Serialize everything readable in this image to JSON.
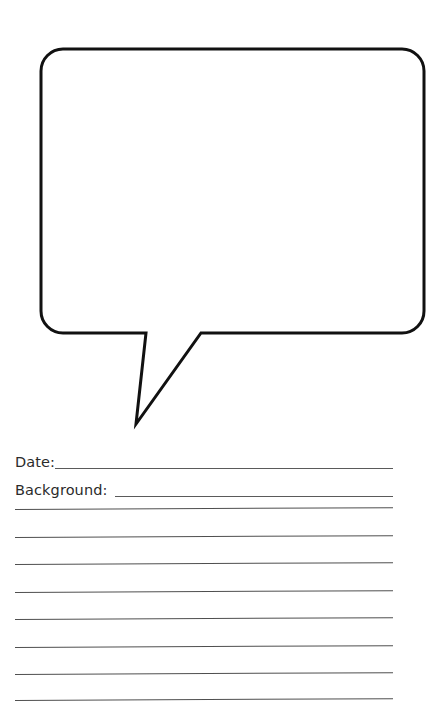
{
  "page": {
    "background_color": "#ffffff",
    "width": 433,
    "height": 726
  },
  "bubble": {
    "name": "speech-bubble",
    "shape": "rounded-rectangle-with-pointed-tail",
    "stroke_color": "#111111",
    "fill_color": "#ffffff",
    "stroke_width": 3,
    "corner_radius": 22,
    "body": {
      "left": 41,
      "top": 49,
      "right": 424,
      "bottom": 333
    },
    "tail": {
      "base_left_x": 146,
      "base_right_x": 201,
      "base_y": 333,
      "tip_x": 136,
      "tip_y": 424
    }
  },
  "fields": [
    {
      "label": "Date:",
      "value": "",
      "rule_color": "#5a5a5a",
      "has_gap": false
    },
    {
      "label": "Background:",
      "value": "",
      "rule_color": "#5a5a5a",
      "has_gap": true
    }
  ],
  "ruled_lines": {
    "count": 8,
    "color": "#4f4f4f",
    "left": 15,
    "right": 393,
    "spacing": 27.2,
    "first_y": 79,
    "values": [
      "",
      "",
      "",
      "",
      "",
      "",
      "",
      ""
    ]
  }
}
